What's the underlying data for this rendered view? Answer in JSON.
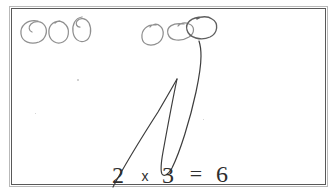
{
  "page": {
    "background_color": "#ffffff",
    "frame_color": "#595959",
    "frame_shadow_color": "#b9b9b9",
    "ink_color": "#3a3a3a",
    "pencil_color": "#8c8c8c"
  },
  "equation": {
    "full_text": "2 x 3 = 6",
    "operand_left": "2",
    "operator": "x",
    "operand_right": "3",
    "equals": "=",
    "result": "6"
  },
  "circle_groups": [
    {
      "name": "left-group",
      "count": 3,
      "label": "group of 3 circles",
      "circles": [
        {
          "cx": 33,
          "cy": 31,
          "rx": 13,
          "ry": 11,
          "rot": -12,
          "color": "#8c8c8c"
        },
        {
          "cx": 59,
          "cy": 32,
          "rx": 10,
          "ry": 11,
          "rot": -8,
          "color": "#8c8c8c"
        },
        {
          "cx": 82,
          "cy": 29,
          "rx": 9,
          "ry": 12,
          "rot": -6,
          "color": "#8c8c8c"
        }
      ]
    },
    {
      "name": "right-group",
      "count": 3,
      "label": "group of 3 circles",
      "circles": [
        {
          "cx": 153,
          "cy": 34,
          "rx": 11,
          "ry": 10,
          "rot": -18,
          "color": "#8c8c8c"
        },
        {
          "cx": 180,
          "cy": 31,
          "rx": 12,
          "ry": 8,
          "rot": -12,
          "color": "#8c8c8c"
        },
        {
          "cx": 202,
          "cy": 28,
          "rx": 14,
          "ry": 11,
          "rot": -10,
          "color": "#5a5a5a"
        }
      ]
    }
  ],
  "connector_lines": [
    {
      "name": "line-from-2-to-left-group",
      "description": "long stroke rising from the digit 2 up to the right"
    },
    {
      "name": "loop-from-3-to-right-circle",
      "description": "narrow V loop from the digit 3 curving up to the rightmost circle"
    }
  ],
  "specks": [
    {
      "x": 77,
      "y": 79,
      "d": 1.6
    },
    {
      "x": 35,
      "y": 113,
      "d": 1.4
    },
    {
      "x": 203,
      "y": 119,
      "d": 1.4
    }
  ]
}
